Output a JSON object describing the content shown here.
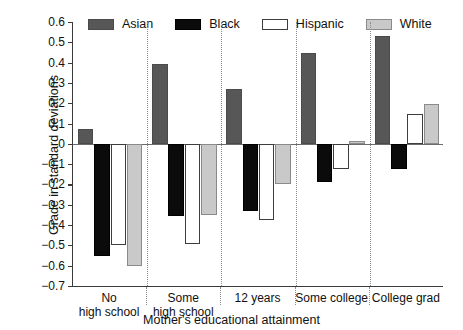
{
  "chart_data": {
    "type": "bar",
    "title": "",
    "xlabel": "Mother's educational attainment",
    "ylabel": "Grade in standard deviations",
    "categories": [
      "No high school",
      "Some high school",
      "12 years",
      "Some college",
      "College grad"
    ],
    "category_lines": [
      [
        "No",
        "high school"
      ],
      [
        "Some",
        "high school"
      ],
      [
        "12 years"
      ],
      [
        "Some college"
      ],
      [
        "College grad"
      ]
    ],
    "series": [
      {
        "name": "Asian",
        "color": "#575757",
        "values": [
          0.075,
          0.395,
          0.27,
          0.445,
          0.53
        ]
      },
      {
        "name": "Black",
        "color": "#0b0b0b",
        "values": [
          -0.55,
          -0.355,
          -0.33,
          -0.19,
          -0.125
        ]
      },
      {
        "name": "Hispanic",
        "color": "#ffffff",
        "values": [
          -0.5,
          -0.495,
          -0.375,
          -0.125,
          0.145
        ]
      },
      {
        "name": "White",
        "color": "#c9c9c9",
        "values": [
          -0.6,
          -0.35,
          -0.2,
          0.015,
          0.195
        ]
      }
    ],
    "ylim": [
      -0.7,
      0.6
    ],
    "yticks": [
      0.6,
      0.5,
      0.4,
      0.3,
      0.2,
      0.1,
      0,
      -0.1,
      -0.2,
      -0.3,
      -0.4,
      -0.5,
      -0.6,
      -0.7
    ],
    "ytick_labels": [
      "0.6",
      "0.5",
      "0.4",
      "0.3",
      "0.2",
      "0.1",
      "0",
      "−0.1",
      "−0.2",
      "−0.3",
      "−0.4",
      "−0.5",
      "−0.6",
      "−0.7"
    ],
    "grid": false,
    "legend_position": "top",
    "zero_line": true,
    "group_separators": true
  }
}
